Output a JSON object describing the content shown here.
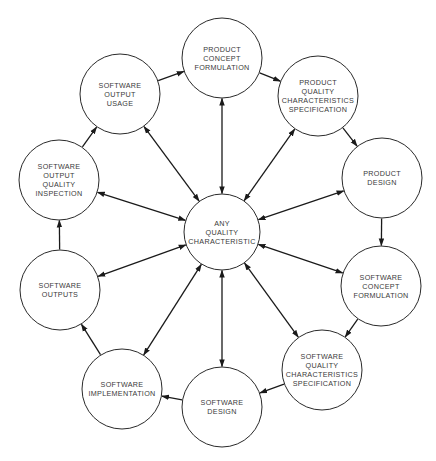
{
  "diagram": {
    "center": {
      "id": "any-quality-characteristic",
      "lines": [
        "ANY",
        "QUALITY",
        "CHARACTERISTIC"
      ],
      "cx": 222,
      "cy": 232,
      "r": 38
    },
    "nodes": [
      {
        "id": "product-concept-formulation",
        "lines": [
          "PRODUCT",
          "CONCEPT",
          "FORMULATION"
        ],
        "cx": 222,
        "cy": 58,
        "r": 40
      },
      {
        "id": "product-quality-characteristics-specification",
        "lines": [
          "PRODUCT",
          "QUALITY",
          "CHARACTERISTICS",
          "SPECIFICATION"
        ],
        "cx": 318,
        "cy": 96,
        "r": 40
      },
      {
        "id": "product-design",
        "lines": [
          "PRODUCT",
          "DESIGN"
        ],
        "cx": 382,
        "cy": 178,
        "r": 40
      },
      {
        "id": "software-concept-formulation",
        "lines": [
          "SOFTWARE",
          "CONCEPT",
          "FORMULATION"
        ],
        "cx": 381,
        "cy": 286,
        "r": 40
      },
      {
        "id": "software-quality-characteristics-specification",
        "lines": [
          "SOFTWARE",
          "QUALITY",
          "CHARACTERISTICS",
          "SPECIFICATION"
        ],
        "cx": 322,
        "cy": 370,
        "r": 40
      },
      {
        "id": "software-design",
        "lines": [
          "SOFTWARE",
          "DESIGN"
        ],
        "cx": 222,
        "cy": 407,
        "r": 40
      },
      {
        "id": "software-implementation",
        "lines": [
          "SOFTWARE",
          "IMPLEMENTATION"
        ],
        "cx": 122,
        "cy": 389,
        "r": 40
      },
      {
        "id": "software-outputs",
        "lines": [
          "SOFTWARE",
          "OUTPUTS"
        ],
        "cx": 60,
        "cy": 290,
        "r": 40
      },
      {
        "id": "software-output-quality-inspection",
        "lines": [
          "SOFTWARE",
          "OUTPUT",
          "QUALITY",
          "INSPECTION"
        ],
        "cx": 59,
        "cy": 180,
        "r": 40
      },
      {
        "id": "software-output-usage",
        "lines": [
          "SOFTWARE",
          "OUTPUT",
          "USAGE"
        ],
        "cx": 120,
        "cy": 94,
        "r": 40
      }
    ],
    "cycle_edges": [
      {
        "from": 0,
        "to": 1
      },
      {
        "from": 1,
        "to": 2
      },
      {
        "from": 2,
        "to": 3
      },
      {
        "from": 3,
        "to": 4
      },
      {
        "from": 4,
        "to": 5
      },
      {
        "from": 5,
        "to": 6
      },
      {
        "from": 6,
        "to": 7
      },
      {
        "from": 7,
        "to": 8
      },
      {
        "from": 8,
        "to": 9
      },
      {
        "from": 9,
        "to": 0
      }
    ],
    "spoke_edges": "bidirectional between center and every outer node",
    "colors": {
      "stroke": "#2a2a2a",
      "text": "#3a3a3a",
      "background": "#ffffff"
    }
  }
}
